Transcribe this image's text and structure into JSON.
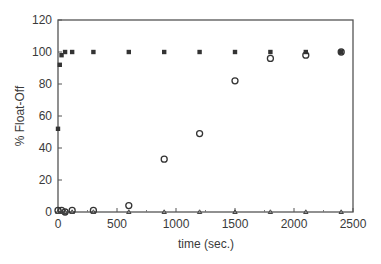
{
  "chart_data": {
    "type": "scatter",
    "title": "",
    "xlabel": "time (sec.)",
    "ylabel": "% Float-Off",
    "xlim": [
      0,
      2500
    ],
    "ylim": [
      0,
      120
    ],
    "xticks": [
      0,
      500,
      1000,
      1500,
      2000,
      2500
    ],
    "yticks": [
      0,
      20,
      40,
      60,
      80,
      100,
      120
    ],
    "grid": false,
    "legend": null,
    "series": [
      {
        "name": "filled squares",
        "marker": "filled-square",
        "x": [
          0,
          15,
          30,
          60,
          120,
          300,
          600,
          900,
          1200,
          1500,
          1800,
          2100,
          2400
        ],
        "y": [
          52,
          92,
          98,
          100,
          100,
          100,
          100,
          100,
          100,
          100,
          100,
          100,
          100
        ]
      },
      {
        "name": "open circles",
        "marker": "open-circle",
        "x": [
          0,
          30,
          60,
          120,
          300,
          600,
          900,
          1200,
          1500,
          1800,
          2100,
          2400
        ],
        "y": [
          1,
          1,
          0,
          1,
          1,
          4,
          33,
          49,
          82,
          96,
          98,
          100
        ]
      },
      {
        "name": "open triangles",
        "marker": "open-triangle",
        "x": [
          0,
          30,
          60,
          120,
          300,
          600,
          900,
          1200,
          1500,
          1800,
          2100,
          2400
        ],
        "y": [
          0,
          0,
          0,
          0,
          0,
          0,
          0,
          0,
          0,
          0,
          0,
          0
        ]
      }
    ]
  }
}
